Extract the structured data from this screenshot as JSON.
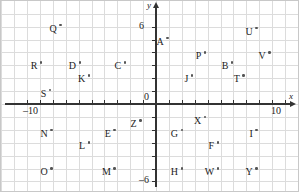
{
  "chart_data": {
    "type": "scatter",
    "title": "",
    "xlabel": "x",
    "ylabel": "y",
    "xlim": [
      -10,
      10
    ],
    "ylim": [
      -7,
      7
    ],
    "grid": true,
    "legend": "none",
    "x_ticks": [
      {
        "value": -10,
        "label": "–10"
      },
      {
        "value": 0,
        "label": "0"
      },
      {
        "value": 10,
        "label": "10"
      }
    ],
    "y_ticks": [
      {
        "value": 6,
        "label": "6"
      },
      {
        "value": -6,
        "label": "–6"
      }
    ],
    "points": [
      {
        "label": "Q",
        "x": -7.5,
        "y": 6.2
      },
      {
        "label": "A",
        "x": 0.8,
        "y": 5.2
      },
      {
        "label": "U",
        "x": 7.7,
        "y": 6.0
      },
      {
        "label": "R",
        "x": -9.0,
        "y": 3.3
      },
      {
        "label": "D",
        "x": -6.0,
        "y": 3.3
      },
      {
        "label": "C",
        "x": -2.5,
        "y": 3.3
      },
      {
        "label": "P",
        "x": 3.7,
        "y": 4.1
      },
      {
        "label": "V",
        "x": 8.7,
        "y": 4.1
      },
      {
        "label": "K",
        "x": -5.3,
        "y": 2.3
      },
      {
        "label": "B",
        "x": 5.8,
        "y": 3.3
      },
      {
        "label": "J",
        "x": 2.7,
        "y": 2.3
      },
      {
        "label": "T",
        "x": 6.7,
        "y": 2.3
      },
      {
        "label": "S",
        "x": -8.3,
        "y": 1.2
      },
      {
        "label": "Z",
        "x": -1.3,
        "y": -1.2
      },
      {
        "label": "X",
        "x": 3.7,
        "y": -0.9
      },
      {
        "label": "N",
        "x": -8.2,
        "y": -1.9
      },
      {
        "label": "E",
        "x": -3.3,
        "y": -1.9
      },
      {
        "label": "G",
        "x": 1.9,
        "y": -1.9
      },
      {
        "label": "I",
        "x": 7.7,
        "y": -1.9
      },
      {
        "label": "L",
        "x": -5.3,
        "y": -2.9
      },
      {
        "label": "F",
        "x": 4.7,
        "y": -2.9
      },
      {
        "label": "O",
        "x": -8.2,
        "y": -4.9
      },
      {
        "label": "M",
        "x": -3.3,
        "y": -4.9
      },
      {
        "label": "H",
        "x": 1.9,
        "y": -4.9
      },
      {
        "label": "W",
        "x": 4.7,
        "y": -4.9
      },
      {
        "label": "Y",
        "x": 7.7,
        "y": -4.9
      }
    ],
    "colors": {
      "grid": "#dcdcdc",
      "axis": "#333333",
      "point": "#555555",
      "label": "#222222",
      "background": "#ffffff",
      "border": "#c8c8c8"
    }
  }
}
